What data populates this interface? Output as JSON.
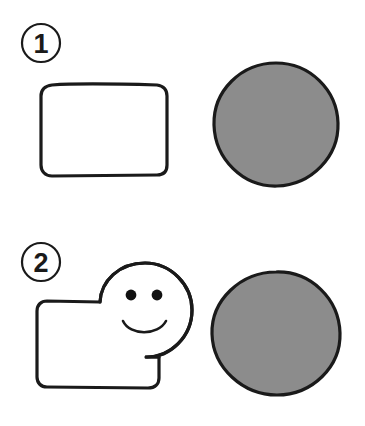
{
  "page": {
    "background_color": "#ffffff",
    "width": 365,
    "height": 426
  },
  "style": {
    "stroke_color": "#1a1a1a",
    "fill_white": "#ffffff",
    "fill_gray": "#8c8c8c",
    "stroke_width_shape": 3.2,
    "stroke_width_badge": 2.2,
    "stroke_width_face": 2.6
  },
  "rows": [
    {
      "id": "row-1",
      "badge": {
        "label": "1",
        "cx": 41,
        "cy": 43,
        "r": 19
      },
      "left_shape": {
        "kind": "rounded-rectangle",
        "name": "plain-rectangle",
        "x": 41,
        "y": 85,
        "width": 126,
        "height": 90,
        "corner_radius": 10,
        "fill": "#ffffff"
      },
      "right_shape": {
        "kind": "circle",
        "name": "gray-circle",
        "cx": 276,
        "cy": 124,
        "r": 61,
        "fill": "#8c8c8c"
      }
    },
    {
      "id": "row-2",
      "badge": {
        "label": "2",
        "cx": 41,
        "cy": 262,
        "r": 19
      },
      "left_shape": {
        "kind": "rectangle-with-face-circle",
        "name": "smiley-face-composite",
        "rect": {
          "x": 37,
          "y": 301,
          "width": 122,
          "height": 86,
          "corner_radius": 10
        },
        "face_circle": {
          "cx": 145,
          "cy": 310,
          "r": 47
        },
        "eyes": [
          {
            "cx": 131,
            "cy": 295,
            "r": 5.4
          },
          {
            "cx": 157,
            "cy": 295,
            "r": 5.4
          }
        ],
        "mouth": {
          "kind": "smile-arc",
          "start_x": 123,
          "start_y": 321,
          "end_x": 166,
          "end_y": 321,
          "sweep_depth": 14
        },
        "fill": "#ffffff"
      },
      "right_shape": {
        "kind": "circle",
        "name": "gray-circle",
        "cx": 276,
        "cy": 333,
        "r": 62,
        "fill": "#8c8c8c"
      }
    }
  ]
}
